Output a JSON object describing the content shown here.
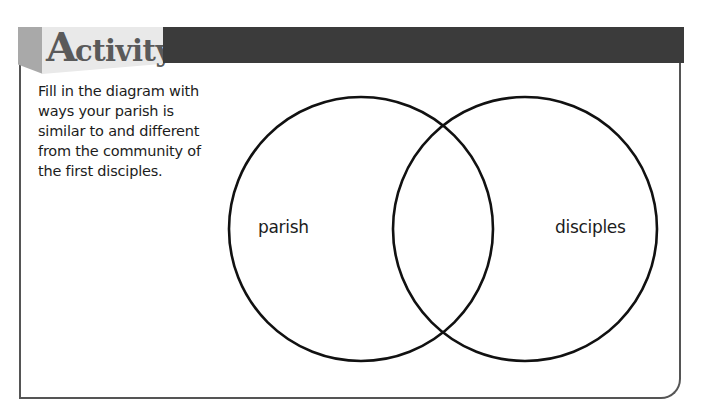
{
  "header": {
    "title_initial": "A",
    "title_rest": "ctivity",
    "side_color": "#a9a9a9",
    "face_color": "#e9e9e9",
    "bar_color": "#3b3b3b",
    "title_color": "#5a5a5a"
  },
  "instructions": {
    "lines": [
      "Fill in the diagram with",
      "ways your parish is",
      "similar to and different",
      "from the community of",
      "the first disciples."
    ]
  },
  "venn": {
    "left_circle": {
      "label": "parish",
      "cx": 361,
      "cy": 229,
      "r": 132
    },
    "right_circle": {
      "label": "disciples",
      "cx": 525,
      "cy": 229,
      "r": 132
    },
    "stroke_color": "#111111"
  },
  "frame": {
    "border_color": "#555555"
  }
}
